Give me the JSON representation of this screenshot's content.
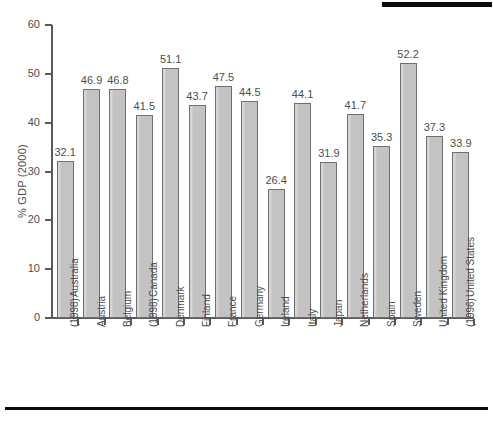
{
  "figure": {
    "top_rule": "",
    "bottom_rule": ""
  },
  "chart_data": {
    "type": "bar",
    "title": "",
    "xlabel": "",
    "ylabel": "% GDP (2000)",
    "ylim": [
      0,
      60
    ],
    "yticks": [
      "0",
      "10",
      "20",
      "30",
      "40",
      "50",
      "60"
    ],
    "grid": false,
    "legend": "none",
    "bar_color": "#c3c3c3",
    "bar_edge_color": "#6f6f6f",
    "axis_color": "#5a5a5a",
    "text_color": "#4d4d4d",
    "categories": [
      "Australia (1998)",
      "Austria",
      "Belgium",
      "Canada (1998)",
      "Denmark",
      "Finland",
      "France",
      "Germany",
      "Ireland",
      "Italy",
      "Japan",
      "Netherlands",
      "Spain",
      "Sweden",
      "United Kingdom",
      "United States (1996)"
    ],
    "category_lines": [
      [
        "Australia",
        "(1998)"
      ],
      [
        "Austria"
      ],
      [
        "Belgium"
      ],
      [
        "Canada",
        "(1998)"
      ],
      [
        "Denmark"
      ],
      [
        "Finland"
      ],
      [
        "France"
      ],
      [
        "Germany"
      ],
      [
        "Ireland"
      ],
      [
        "Italy"
      ],
      [
        "Japan"
      ],
      [
        "Netherlands"
      ],
      [
        "Spain"
      ],
      [
        "Sweden"
      ],
      [
        "United Kingdom"
      ],
      [
        "United States",
        "(1996)"
      ]
    ],
    "values": [
      32.1,
      46.9,
      46.8,
      41.5,
      51.1,
      43.7,
      47.5,
      44.5,
      26.4,
      44.1,
      31.9,
      41.7,
      35.3,
      52.2,
      37.3,
      33.9
    ],
    "value_labels": [
      "32.1",
      "46.9",
      "46.8",
      "41.5",
      "51.1",
      "43.7",
      "47.5",
      "44.5",
      "26.4",
      "44.1",
      "31.9",
      "41.7",
      "35.3",
      "52.2",
      "37.3",
      "33.9"
    ]
  }
}
